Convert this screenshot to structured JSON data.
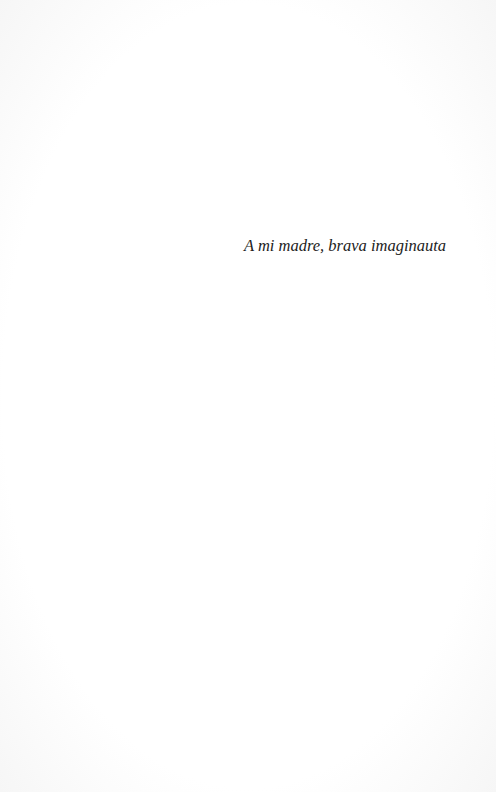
{
  "page": {
    "dedication": "A mi madre, brava imaginauta"
  }
}
